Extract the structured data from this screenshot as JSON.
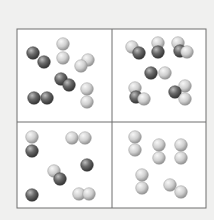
{
  "diagram": {
    "background": "#f0f0ef",
    "frame": {
      "x": 17,
      "y": 29,
      "width": 189,
      "height": 179,
      "divider_x": 112,
      "divider_y": 122,
      "stroke": "#6e6e6e",
      "fill": "#ffffff"
    },
    "colors": {
      "dark_atom": {
        "light": "#bdbdbd",
        "mid": "#6a6a6a",
        "dark": "#2e2e2e"
      },
      "light_atom": {
        "light": "#f7f7f7",
        "mid": "#cfcfcf",
        "dark": "#8a8a8a"
      }
    },
    "atom_radius": 6.3,
    "panels": [
      {
        "name": "panel-top-left",
        "description": "Mixture of dark diatomic and light diatomic molecules",
        "atoms": [
          {
            "x": 33,
            "y": 53,
            "type": "dark"
          },
          {
            "x": 44,
            "y": 62,
            "type": "dark"
          },
          {
            "x": 63,
            "y": 44,
            "type": "light"
          },
          {
            "x": 63,
            "y": 58,
            "type": "light"
          },
          {
            "x": 88,
            "y": 60,
            "type": "light"
          },
          {
            "x": 81,
            "y": 66,
            "type": "light"
          },
          {
            "x": 61,
            "y": 79,
            "type": "dark"
          },
          {
            "x": 69,
            "y": 85,
            "type": "dark"
          },
          {
            "x": 34,
            "y": 98,
            "type": "dark"
          },
          {
            "x": 47,
            "y": 98,
            "type": "dark"
          },
          {
            "x": 87,
            "y": 89,
            "type": "light"
          },
          {
            "x": 87,
            "y": 102,
            "type": "light"
          }
        ]
      },
      {
        "name": "panel-top-right",
        "description": "Compound molecules of dark and light atoms",
        "atoms": [
          {
            "x": 132,
            "y": 47,
            "type": "light"
          },
          {
            "x": 139,
            "y": 53,
            "type": "dark"
          },
          {
            "x": 158,
            "y": 43,
            "type": "light"
          },
          {
            "x": 158,
            "y": 52,
            "type": "dark"
          },
          {
            "x": 178,
            "y": 43,
            "type": "light"
          },
          {
            "x": 180,
            "y": 51,
            "type": "dark"
          },
          {
            "x": 187,
            "y": 52,
            "type": "light"
          },
          {
            "x": 151,
            "y": 73,
            "type": "dark"
          },
          {
            "x": 165,
            "y": 73,
            "type": "light"
          },
          {
            "x": 135,
            "y": 88,
            "type": "light"
          },
          {
            "x": 136,
            "y": 97,
            "type": "dark"
          },
          {
            "x": 144,
            "y": 99,
            "type": "light"
          },
          {
            "x": 185,
            "y": 86,
            "type": "light"
          },
          {
            "x": 175,
            "y": 92,
            "type": "dark"
          },
          {
            "x": 185,
            "y": 99,
            "type": "light"
          }
        ]
      },
      {
        "name": "panel-bottom-left",
        "description": "Mixture of single dark atoms, light diatomic and mixed molecules",
        "atoms": [
          {
            "x": 32,
            "y": 137,
            "type": "light"
          },
          {
            "x": 32,
            "y": 151,
            "type": "dark"
          },
          {
            "x": 72,
            "y": 138,
            "type": "light"
          },
          {
            "x": 85,
            "y": 138,
            "type": "light"
          },
          {
            "x": 87,
            "y": 165,
            "type": "dark"
          },
          {
            "x": 54,
            "y": 171,
            "type": "light"
          },
          {
            "x": 60,
            "y": 179,
            "type": "dark"
          },
          {
            "x": 32,
            "y": 195,
            "type": "dark"
          },
          {
            "x": 79,
            "y": 194,
            "type": "light"
          },
          {
            "x": 89,
            "y": 194,
            "type": "light"
          }
        ]
      },
      {
        "name": "panel-bottom-right",
        "description": "Only light diatomic molecules",
        "atoms": [
          {
            "x": 135,
            "y": 137,
            "type": "light"
          },
          {
            "x": 135,
            "y": 150,
            "type": "light"
          },
          {
            "x": 159,
            "y": 145,
            "type": "light"
          },
          {
            "x": 159,
            "y": 158,
            "type": "light"
          },
          {
            "x": 181,
            "y": 145,
            "type": "light"
          },
          {
            "x": 181,
            "y": 158,
            "type": "light"
          },
          {
            "x": 142,
            "y": 175,
            "type": "light"
          },
          {
            "x": 142,
            "y": 188,
            "type": "light"
          },
          {
            "x": 170,
            "y": 185,
            "type": "light"
          },
          {
            "x": 181,
            "y": 192,
            "type": "light"
          }
        ]
      }
    ]
  }
}
